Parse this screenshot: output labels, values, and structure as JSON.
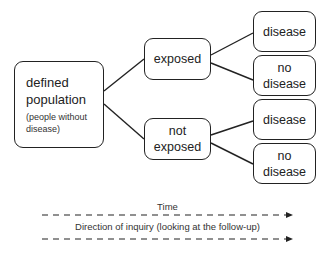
{
  "diagram": {
    "type": "prospective cohort study flow",
    "root": {
      "title_line1": "defined",
      "title_line2": "population",
      "subtitle_line1": "(people without",
      "subtitle_line2": "disease)"
    },
    "groups": [
      {
        "label_line1": "exposed",
        "label_line2": "",
        "outcomes": [
          {
            "line1": "disease",
            "line2": ""
          },
          {
            "line1": "no",
            "line2": "disease"
          }
        ]
      },
      {
        "label_line1": "not",
        "label_line2": "exposed",
        "outcomes": [
          {
            "line1": "disease",
            "line2": ""
          },
          {
            "line1": "no",
            "line2": "disease"
          }
        ]
      }
    ],
    "time_label": "Time",
    "inquiry_label": "Direction of inquiry (looking at the follow-up)"
  },
  "colors": {
    "line": "#222222",
    "background": "#ffffff"
  }
}
